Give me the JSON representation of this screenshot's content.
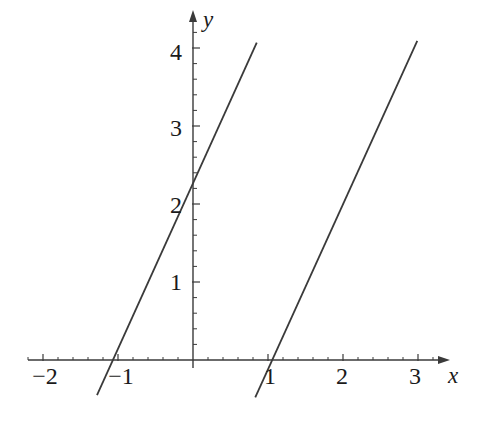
{
  "figure": {
    "background_color": "#ffffff",
    "ink_color": "#3a3a3a",
    "text_color": "#1a1a1a"
  },
  "axes": {
    "x_axis_name": "x",
    "y_axis_name": "y",
    "x_tick_labels": [
      "−2",
      "−1",
      "1",
      "2",
      "3"
    ],
    "y_tick_labels": [
      "1",
      "2",
      "3",
      "4"
    ],
    "origin_label": ""
  },
  "chart_data": {
    "type": "line",
    "title": "",
    "xlabel": "x",
    "ylabel": "y",
    "grid": false,
    "legend": "none",
    "xlim": [
      -2.2,
      3.4
    ],
    "ylim": [
      -0.5,
      4.5
    ],
    "xticks": [
      -2,
      -1,
      1,
      2,
      3
    ],
    "yticks": [
      1,
      2,
      3,
      4
    ],
    "x_minor_tick_step": 0.2,
    "y_minor_tick_step": 0.2,
    "series": [
      {
        "name": "line-1",
        "slope": 2.12,
        "intercept": 2.26,
        "x_intercept": -1.07,
        "y_intercept": 2.26,
        "x": [
          -1.28,
          0.85
        ],
        "y": [
          -0.45,
          4.07
        ]
      },
      {
        "name": "line-2",
        "slope": 2.12,
        "intercept": -2.23,
        "x_intercept": 1.05,
        "y_intercept": -2.23,
        "x": [
          0.83,
          2.99
        ],
        "y": [
          -0.48,
          4.09
        ]
      }
    ]
  },
  "geometry": {
    "origin_px": {
      "x": 193,
      "y": 360
    },
    "unit_px": {
      "x": 75,
      "y": 78
    },
    "x_axis_span_px": {
      "start": 28,
      "end": 450
    },
    "y_axis_span_px": {
      "start": 10,
      "end": 368
    }
  }
}
